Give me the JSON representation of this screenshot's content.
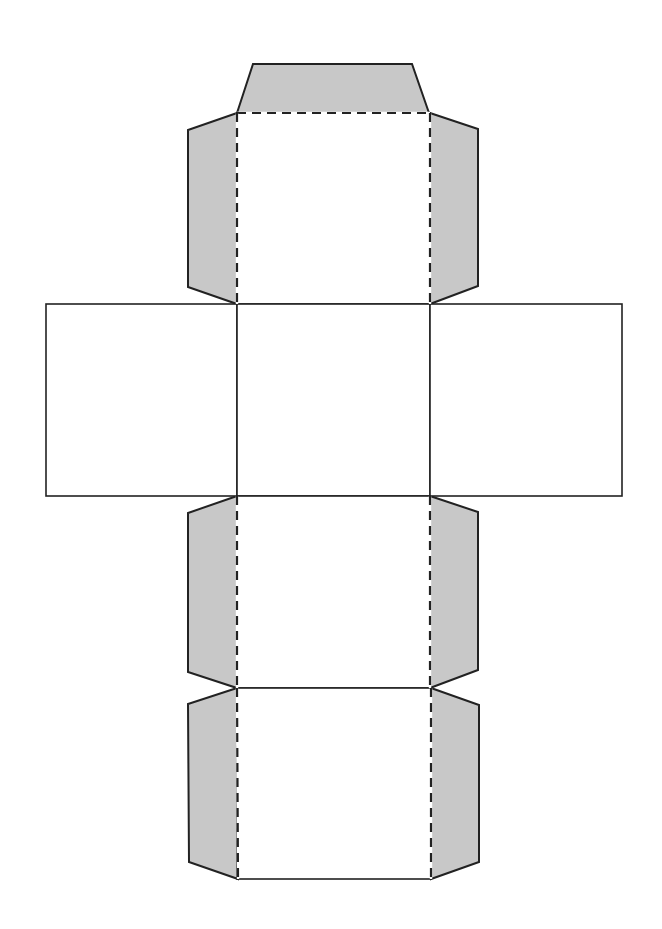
{
  "diagram": {
    "canvas": {
      "width": 662,
      "height": 929
    },
    "colors": {
      "background": "#ffffff",
      "tab_fill": "#c8c8c8",
      "line": "#222222"
    },
    "faces": [
      {
        "id": "top",
        "x": 237,
        "y": 113,
        "w": 193,
        "h": 191
      },
      {
        "id": "left",
        "x": 46,
        "y": 304,
        "w": 191,
        "h": 192
      },
      {
        "id": "center",
        "x": 237,
        "y": 304,
        "w": 193,
        "h": 192
      },
      {
        "id": "right",
        "x": 430,
        "y": 304,
        "w": 192,
        "h": 192
      },
      {
        "id": "lower",
        "x": 237,
        "y": 496,
        "w": 193,
        "h": 192
      },
      {
        "id": "bottom",
        "x": 237,
        "y": 688,
        "w": 194,
        "h": 191
      }
    ],
    "tabs": [
      {
        "id": "tab-top-cap",
        "points": "237,113 253,64 412,64 429,113"
      },
      {
        "id": "tab-top-left",
        "points": "237,113 188,130 188,287 237,304"
      },
      {
        "id": "tab-top-right",
        "points": "430,113 478,129 478,286 430,304"
      },
      {
        "id": "tab-lower-left",
        "points": "237,496 188,513 188,672 237,688"
      },
      {
        "id": "tab-lower-right",
        "points": "430,496 478,512 478,670 430,688"
      },
      {
        "id": "tab-bottom-left",
        "points": "237,688 188,704 189,862 238,879"
      },
      {
        "id": "tab-bottom-right",
        "points": "431,688 479,705 479,862 431,879"
      }
    ],
    "fold_lines": [
      {
        "id": "fold-top-cap",
        "x1": 237,
        "y1": 113,
        "x2": 430,
        "y2": 113
      },
      {
        "id": "fold-top-left",
        "x1": 237,
        "y1": 113,
        "x2": 237,
        "y2": 304
      },
      {
        "id": "fold-top-right",
        "x1": 430,
        "y1": 113,
        "x2": 430,
        "y2": 304
      },
      {
        "id": "fold-lower-left",
        "x1": 237,
        "y1": 496,
        "x2": 237,
        "y2": 688
      },
      {
        "id": "fold-lower-right",
        "x1": 430,
        "y1": 496,
        "x2": 430,
        "y2": 688
      },
      {
        "id": "fold-bottom-left",
        "x1": 237,
        "y1": 688,
        "x2": 238,
        "y2": 879
      },
      {
        "id": "fold-bottom-right",
        "x1": 431,
        "y1": 688,
        "x2": 431,
        "y2": 879
      }
    ]
  }
}
